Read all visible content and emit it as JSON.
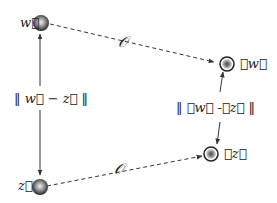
{
  "nodes": {
    "w": {
      "label": "w⃗"
    },
    "z": {
      "label": "z⃗"
    },
    "Ow": {
      "label": "𝒪w⃗"
    },
    "Oz": {
      "label": "𝒪z⃗"
    }
  },
  "edges": {
    "top_operator": "𝒪",
    "bottom_operator": "𝒪",
    "left_distance": "‖ w⃗ − z⃗ ‖",
    "right_distance": "‖ 𝒪w⃗ -𝒪z⃗ ‖"
  },
  "colors": {
    "line": "#333333",
    "node_dark": "#2a2a2a",
    "node_light": "#e8e8e8"
  }
}
